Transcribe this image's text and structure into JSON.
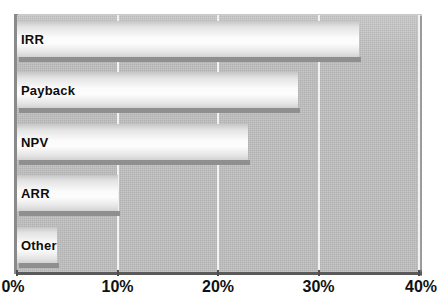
{
  "chart_data": {
    "type": "bar",
    "orientation": "horizontal",
    "title": "",
    "subtitle": "",
    "xlabel": "",
    "ylabel": "",
    "categories": [
      "IRR",
      "Payback",
      "NPV",
      "ARR",
      "Other"
    ],
    "values": [
      34,
      28,
      23,
      10,
      4
    ],
    "value_suffix": "%",
    "xlim": [
      0,
      40
    ],
    "xticks": [
      0,
      10,
      20,
      30,
      40
    ],
    "xtick_labels": [
      "0%",
      "10%",
      "20%",
      "30%",
      "40%"
    ],
    "grid": "vertical-only",
    "legend": "none",
    "series": [
      {
        "name": "Share of respondents",
        "values": [
          34,
          28,
          23,
          10,
          4
        ]
      }
    ],
    "colors": {
      "plot_background": "#bfbfbf",
      "bar_fill_light": "#fdfdfd",
      "bar_fill_dark": "#c6c6c6",
      "bar_shadow": "#8f8f8f",
      "gridline": "#f2f2f2",
      "axis": "#5a5a5a",
      "text": "#111111",
      "page_background": "#ffffff"
    }
  },
  "axis": {
    "ticks": [
      {
        "label": "0%",
        "value": 0
      },
      {
        "label": "10%",
        "value": 10
      },
      {
        "label": "20%",
        "value": 20
      },
      {
        "label": "30%",
        "value": 30
      },
      {
        "label": "40%",
        "value": 40
      }
    ]
  },
  "bars": [
    {
      "label": "IRR",
      "value": 34
    },
    {
      "label": "Payback",
      "value": 28
    },
    {
      "label": "NPV",
      "value": 23
    },
    {
      "label": "ARR",
      "value": 10
    },
    {
      "label": "Other",
      "value": 4
    }
  ]
}
